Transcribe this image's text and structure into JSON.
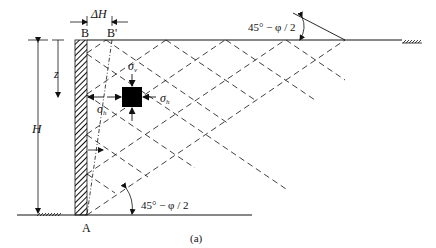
{
  "figure": {
    "caption": "(a)",
    "labels": {
      "delta_h": "ΔH",
      "b": "B",
      "b_prime": "B'",
      "a": "A",
      "z": "z",
      "h": "H",
      "sigma": "σ",
      "sigma_v_sub": "v",
      "sigma_h_sub": "h",
      "angle_top": "45° − φ / 2",
      "angle_bottom": "45° − φ / 2"
    },
    "colors": {
      "line": "#111111",
      "background": "#ffffff"
    }
  }
}
